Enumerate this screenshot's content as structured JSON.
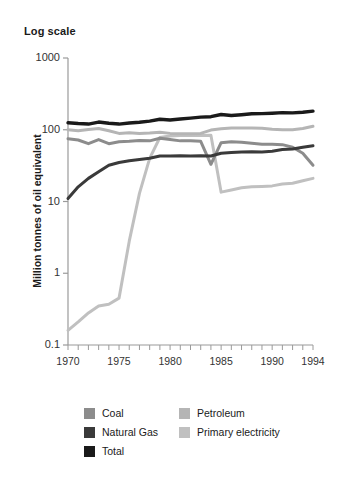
{
  "chart_data": {
    "type": "line",
    "title": "Log scale",
    "xlabel": "",
    "ylabel": "Million tonnes of oil equivalent",
    "log_y": true,
    "ylim": [
      0.1,
      1000
    ],
    "xlim": [
      1970,
      1994
    ],
    "grid": false,
    "legend_position": "bottom",
    "ytick_labels": [
      "1000",
      "100",
      "10",
      "1",
      "0.1"
    ],
    "ytick_values": [
      1000,
      100,
      10,
      1,
      0.1
    ],
    "xtick_labels": [
      "1970",
      "1975",
      "1980",
      "1985",
      "1990",
      "1994"
    ],
    "xtick_values": [
      1970,
      1975,
      1980,
      1985,
      1990,
      1994
    ],
    "x": [
      1970,
      1971,
      1972,
      1973,
      1974,
      1975,
      1976,
      1977,
      1978,
      1979,
      1980,
      1981,
      1982,
      1983,
      1984,
      1985,
      1986,
      1987,
      1988,
      1989,
      1990,
      1991,
      1992,
      1993,
      1994
    ],
    "series": [
      {
        "name": "Coal",
        "color": "#8c8c8c",
        "values": [
          75,
          72,
          64,
          73,
          64,
          68,
          69,
          71,
          70,
          76,
          73,
          70,
          70,
          69,
          33,
          66,
          68,
          67,
          65,
          63,
          63,
          62,
          57,
          47,
          32
        ]
      },
      {
        "name": "Natural Gas",
        "color": "#3a3a3a",
        "values": [
          11.0,
          16.0,
          21.0,
          26.0,
          32.0,
          35.0,
          37.0,
          38.5,
          40.0,
          43.0,
          43.0,
          43.5,
          43.0,
          43.5,
          43.0,
          47.0,
          48.0,
          49.0,
          49.5,
          49.0,
          50.0,
          53.0,
          54.0,
          57.0,
          60.0
        ]
      },
      {
        "name": "Total",
        "color": "#1a1a1a",
        "values": [
          125,
          122,
          120,
          128,
          123,
          120,
          124,
          127,
          132,
          140,
          137,
          141,
          145,
          150,
          152,
          163,
          158,
          162,
          167,
          168,
          170,
          173,
          172,
          175,
          182
        ]
      },
      {
        "name": "Petroleum",
        "color": "#b5b5b5",
        "values": [
          100,
          97,
          101,
          104,
          97,
          89,
          91,
          89,
          90,
          92,
          89,
          88,
          88,
          89,
          99,
          103,
          106,
          106,
          106,
          105,
          102,
          100,
          100,
          104,
          112
        ]
      },
      {
        "name": "Primary electricity",
        "color": "#c0c0c0",
        "values": [
          0.16,
          0.21,
          0.28,
          0.35,
          0.37,
          0.45,
          2.8,
          13.0,
          40.0,
          78.0,
          82.0,
          83.0,
          83.0,
          83.0,
          84.0,
          13.5,
          14.5,
          15.5,
          16.0,
          16.2,
          16.5,
          17.5,
          18.0,
          19.5,
          21.0
        ]
      }
    ],
    "legend_entries": [
      {
        "label": "Coal",
        "color": "#8c8c8c"
      },
      {
        "label": "Natural Gas",
        "color": "#3a3a3a"
      },
      {
        "label": "Total",
        "color": "#1a1a1a"
      },
      {
        "label": "Petroleum",
        "color": "#b5b5b5"
      },
      {
        "label": "Primary electricity",
        "color": "#c0c0c0"
      }
    ]
  }
}
